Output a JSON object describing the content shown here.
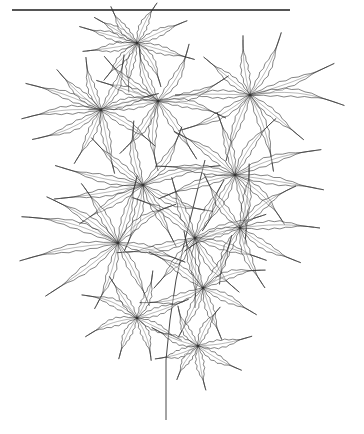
{
  "image": {
    "subject": "Botanical line drawing of a Japanese maple branch with deeply dissected, serrated leaves",
    "style": "black ink line art on white",
    "colors": {
      "background": "#ffffff",
      "ink": "#333333",
      "rule": "#555555"
    }
  },
  "top_rule": {
    "x1": 12,
    "x2": 290,
    "y": 10
  },
  "stem": {
    "points": [
      [
        166,
        420
      ],
      [
        166,
        360
      ],
      [
        170,
        320
      ],
      [
        176,
        280
      ],
      [
        185,
        240
      ],
      [
        195,
        200
      ],
      [
        205,
        160
      ]
    ]
  },
  "leaf_clusters": [
    {
      "id": "top-center",
      "cx": 137,
      "cy": 43,
      "lobes": [
        [
          -70,
          -20,
          60
        ],
        [
          -50,
          -30,
          50
        ],
        [
          -25,
          -35,
          45
        ],
        [
          20,
          -40,
          45
        ],
        [
          45,
          -20,
          55
        ],
        [
          70,
          20,
          60
        ],
        [
          30,
          55,
          50
        ],
        [
          -10,
          60,
          50
        ],
        [
          -40,
          45,
          50
        ],
        [
          -65,
          10,
          55
        ]
      ]
    },
    {
      "id": "upper-right",
      "cx": 250,
      "cy": 95,
      "lobes": [
        [
          -10,
          -85,
          60
        ],
        [
          30,
          -60,
          70
        ],
        [
          80,
          -30,
          90
        ],
        [
          90,
          10,
          95
        ],
        [
          60,
          50,
          70
        ],
        [
          20,
          65,
          80
        ],
        [
          -20,
          55,
          70
        ],
        [
          -60,
          30,
          80
        ],
        [
          -85,
          0,
          75
        ],
        [
          -55,
          -45,
          60
        ]
      ]
    },
    {
      "id": "upper-mid",
      "cx": 158,
      "cy": 101,
      "lobes": [
        [
          -60,
          -50,
          70
        ],
        [
          -20,
          -60,
          60
        ],
        [
          30,
          -55,
          65
        ],
        [
          70,
          -25,
          75
        ],
        [
          80,
          20,
          70
        ],
        [
          40,
          60,
          70
        ],
        [
          0,
          70,
          70
        ],
        [
          -40,
          55,
          65
        ],
        [
          -80,
          10,
          70
        ],
        [
          -75,
          -25,
          65
        ]
      ]
    },
    {
      "id": "upper-left",
      "cx": 101,
      "cy": 110,
      "lobes": [
        [
          -85,
          -30,
          80
        ],
        [
          -60,
          -55,
          60
        ],
        [
          -20,
          -70,
          55
        ],
        [
          25,
          -60,
          60
        ],
        [
          70,
          -20,
          60
        ],
        [
          60,
          40,
          65
        ],
        [
          15,
          70,
          65
        ],
        [
          -30,
          60,
          60
        ],
        [
          -70,
          30,
          75
        ],
        [
          -90,
          10,
          80
        ]
      ]
    },
    {
      "id": "mid-left",
      "cx": 143,
      "cy": 185,
      "lobes": [
        [
          -90,
          -20,
          90
        ],
        [
          -60,
          -55,
          70
        ],
        [
          -10,
          -70,
          65
        ],
        [
          40,
          -60,
          70
        ],
        [
          80,
          -20,
          80
        ],
        [
          80,
          30,
          75
        ],
        [
          35,
          65,
          70
        ],
        [
          -20,
          70,
          70
        ],
        [
          -65,
          40,
          75
        ],
        [
          -95,
          15,
          90
        ]
      ]
    },
    {
      "id": "mid-right",
      "cx": 235,
      "cy": 175,
      "lobes": [
        [
          -70,
          -50,
          75
        ],
        [
          -20,
          -70,
          65
        ],
        [
          40,
          -55,
          70
        ],
        [
          85,
          -25,
          90
        ],
        [
          90,
          15,
          90
        ],
        [
          55,
          55,
          70
        ],
        [
          10,
          70,
          70
        ],
        [
          -35,
          60,
          65
        ],
        [
          -80,
          25,
          80
        ],
        [
          -90,
          -10,
          80
        ]
      ]
    },
    {
      "id": "center",
      "cx": 195,
      "cy": 238,
      "lobes": [
        [
          -70,
          -45,
          75
        ],
        [
          -25,
          -65,
          65
        ],
        [
          30,
          -60,
          65
        ],
        [
          75,
          -25,
          75
        ],
        [
          80,
          25,
          75
        ],
        [
          45,
          55,
          70
        ],
        [
          0,
          70,
          70
        ],
        [
          -45,
          55,
          65
        ],
        [
          -80,
          15,
          80
        ]
      ]
    },
    {
      "id": "center-right",
      "cx": 240,
      "cy": 228,
      "lobes": [
        [
          -40,
          -60,
          65
        ],
        [
          10,
          -70,
          65
        ],
        [
          60,
          -45,
          70
        ],
        [
          90,
          0,
          80
        ],
        [
          70,
          40,
          70
        ],
        [
          25,
          60,
          65
        ],
        [
          -20,
          55,
          60
        ],
        [
          -60,
          25,
          60
        ]
      ]
    },
    {
      "id": "lower-left",
      "cx": 118,
      "cy": 243,
      "lobes": [
        [
          -110,
          -30,
          100
        ],
        [
          -85,
          -55,
          85
        ],
        [
          -40,
          -65,
          70
        ],
        [
          20,
          -70,
          70
        ],
        [
          60,
          -40,
          70
        ],
        [
          70,
          20,
          70
        ],
        [
          30,
          60,
          70
        ],
        [
          -25,
          70,
          70
        ],
        [
          -75,
          55,
          90
        ],
        [
          -110,
          20,
          100
        ]
      ]
    },
    {
      "id": "lower-mid",
      "cx": 203,
      "cy": 288,
      "lobes": [
        [
          -60,
          -40,
          65
        ],
        [
          -20,
          -60,
          60
        ],
        [
          30,
          -55,
          60
        ],
        [
          70,
          -20,
          65
        ],
        [
          60,
          30,
          60
        ],
        [
          20,
          55,
          55
        ],
        [
          -25,
          50,
          55
        ],
        [
          -65,
          15,
          65
        ]
      ]
    },
    {
      "id": "lower-left-2",
      "cx": 137,
      "cy": 318,
      "lobes": [
        [
          -60,
          -25,
          60
        ],
        [
          -30,
          -45,
          50
        ],
        [
          15,
          -45,
          50
        ],
        [
          55,
          -20,
          55
        ],
        [
          50,
          25,
          50
        ],
        [
          15,
          45,
          45
        ],
        [
          -20,
          45,
          45
        ],
        [
          -55,
          20,
          55
        ]
      ]
    },
    {
      "id": "bottom",
      "cx": 198,
      "cy": 346,
      "lobes": [
        [
          -50,
          -20,
          50
        ],
        [
          -20,
          -40,
          45
        ],
        [
          20,
          -35,
          45
        ],
        [
          55,
          -10,
          55
        ],
        [
          45,
          25,
          50
        ],
        [
          8,
          45,
          45
        ],
        [
          -25,
          40,
          40
        ],
        [
          -50,
          15,
          45
        ]
      ]
    }
  ]
}
